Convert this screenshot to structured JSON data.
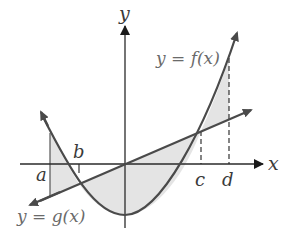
{
  "diagram": {
    "axes": {
      "x_label": "x",
      "y_label": "y"
    },
    "curves": {
      "f_label": "y = f(x)",
      "g_label": "y = g(x)"
    },
    "points": {
      "a": "a",
      "b": "b",
      "c": "c",
      "d": "d"
    },
    "colors": {
      "curve": "#4a4a4a",
      "axis": "#2a2a2a",
      "shade": "#e6e6e6",
      "label": "#3a3a3a"
    }
  }
}
